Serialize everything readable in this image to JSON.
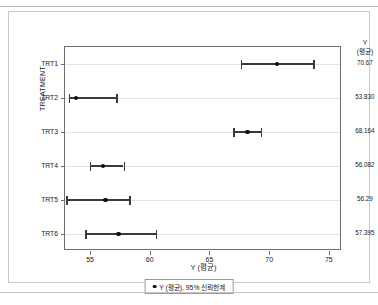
{
  "chart_data": {
    "type": "scatter",
    "orientation": "horizontal",
    "title": "",
    "xlabel": "Y (평균)",
    "ylabel": "TREATMENT",
    "xlim": [
      52.9,
      76.1
    ],
    "xticks": [
      55,
      60,
      65,
      70,
      75
    ],
    "xtick_labels": [
      "55",
      "60",
      "65",
      "70",
      "75"
    ],
    "categories": [
      "TRT1",
      "TRT2",
      "TRT3",
      "TRT4",
      "TRT5",
      "TRT6"
    ],
    "values": [
      70.67,
      53.83,
      68.164,
      56.082,
      56.29,
      57.395
    ],
    "ci_lower": [
      67.6,
      53.2,
      67.0,
      55.0,
      53.0,
      54.6
    ],
    "ci_upper": [
      73.7,
      57.2,
      69.3,
      57.8,
      58.3,
      60.5
    ],
    "value_labels": [
      "70.67",
      "53.830",
      "68.164",
      "56.082",
      "56.29",
      "57.395"
    ],
    "right_column_header_line1": "Y",
    "right_column_header_line2": "(평균)",
    "grid": true,
    "legend_position": "bottom",
    "legend_entries": [
      "Y (평균), 95% 신뢰한계"
    ]
  },
  "legend": {
    "label": "Y (평균), 95% 신뢰한계"
  },
  "footer": {
    "caption": ""
  }
}
